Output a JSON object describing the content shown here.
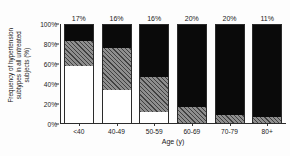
{
  "chart_data": {
    "type": "bar",
    "title": "",
    "subtitle": "",
    "xlabel": "Age (y)",
    "ylabel_line1": "Frequency of hypertension",
    "ylabel_line2": "subtypes in all untreated",
    "ylabel_line3": "subjects (%)",
    "ylabel": "Frequency of hypertension subtypes in all untreated subjects (%)",
    "categories": [
      "<40",
      "40-49",
      "50-59",
      "60-69",
      "70-79",
      "80+"
    ],
    "ylim": [
      0,
      100
    ],
    "yticks": [
      "0%",
      "20%",
      "40%",
      "60%",
      "80%",
      "100%"
    ],
    "ytick_values": [
      0,
      20,
      40,
      60,
      80,
      100
    ],
    "grid": false,
    "legend": "none",
    "stacked": true,
    "stack_order_bottom_to_top": [
      "white",
      "hatched",
      "black"
    ],
    "series": [
      {
        "name": "white",
        "fill": "white",
        "values": [
          57,
          33,
          11,
          0,
          0,
          0
        ]
      },
      {
        "name": "hatched",
        "fill": "gray-diagonal-hatch",
        "values": [
          25,
          42,
          35,
          16,
          8,
          6
        ]
      },
      {
        "name": "black",
        "fill": "black",
        "values": [
          18,
          25,
          54,
          84,
          92,
          94
        ]
      }
    ],
    "bar_annotations": [
      "17%",
      "16%",
      "16%",
      "20%",
      "20%",
      "11%"
    ],
    "colors": {
      "black": "#0a0a0a",
      "hatch_base": "#8e8e8e",
      "hatch_line": "#3c3c3c",
      "white": "#ffffff",
      "axis": "#2b2b2b",
      "background": "#fdfdfd"
    }
  }
}
